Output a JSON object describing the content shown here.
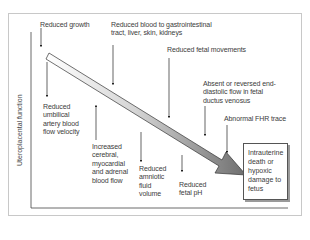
{
  "diagram": {
    "y_axis_label": "Uteroplacental function",
    "main_arrow": {
      "direction": "down-right",
      "gradient": [
        "#ffffff",
        "#c8c8c8",
        "#7a7a7a"
      ]
    },
    "effects_above": [
      {
        "id": "growth",
        "text": "Reduced growth"
      },
      {
        "id": "gi_blood",
        "line1": "Reduced blood to gastrointestinal",
        "line2": "tract, liver, skin, kidneys"
      },
      {
        "id": "fetal_movements",
        "text": "Reduced fetal movements"
      },
      {
        "id": "ductus_venosus",
        "line1": "Absent or reversed end-",
        "line2": "diastolic flow in fetal",
        "line3": "ductus venosus"
      },
      {
        "id": "fhr",
        "text": "Abnormal FHR trace"
      }
    ],
    "effects_below": [
      {
        "id": "umbilical",
        "line1": "Reduced",
        "line2": "umbilical",
        "line3": "artery blood",
        "line4": "flow velocity"
      },
      {
        "id": "cerebral",
        "line1": "Increased",
        "line2": "cerebral,",
        "line3": "myocardial",
        "line4": "and adrenal",
        "line5": "blood flow"
      },
      {
        "id": "amniotic",
        "line1": "Reduced",
        "line2": "amniotic",
        "line3": "fluid",
        "line4": "volume"
      },
      {
        "id": "ph",
        "line1": "Reduced",
        "line2": "fetal pH"
      }
    ],
    "outcome": {
      "line1": "Intrauterine",
      "line2": "death or",
      "line3": "hypoxic",
      "line4": "damage to",
      "line5": "fetus"
    }
  }
}
